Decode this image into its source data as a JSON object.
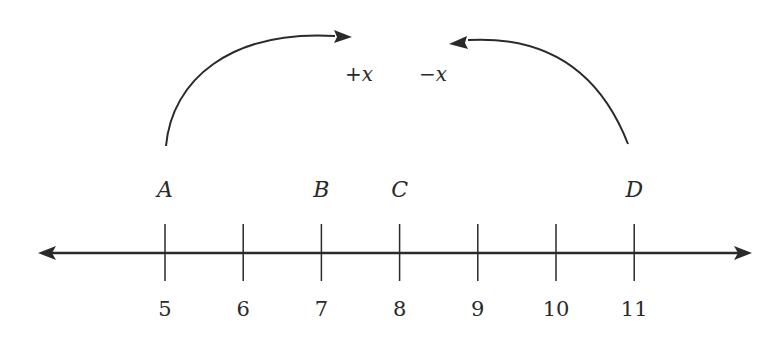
{
  "diagram": {
    "type": "number-line",
    "axis": {
      "min_visible": 5,
      "max_visible": 11,
      "arrows": "both"
    },
    "ticks": [
      {
        "value": 5,
        "label": "5"
      },
      {
        "value": 6,
        "label": "6"
      },
      {
        "value": 7,
        "label": "7"
      },
      {
        "value": 8,
        "label": "8"
      },
      {
        "value": 9,
        "label": "9"
      },
      {
        "value": 10,
        "label": "10"
      },
      {
        "value": 11,
        "label": "11"
      }
    ],
    "points": [
      {
        "name": "A",
        "value": 5
      },
      {
        "name": "B",
        "value": 7
      },
      {
        "name": "C",
        "value": 8
      },
      {
        "name": "D",
        "value": 11
      }
    ],
    "jumps": [
      {
        "from": "A",
        "direction": "right",
        "label": "+x"
      },
      {
        "from": "D",
        "direction": "left",
        "label": "−x"
      }
    ],
    "colors": {
      "ink": "#2a2a2a",
      "background": "#ffffff"
    }
  }
}
